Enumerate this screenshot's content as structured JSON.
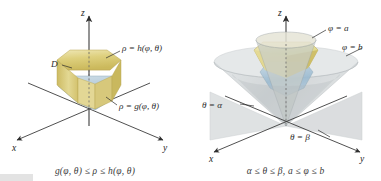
{
  "figure": {
    "background_color": "#ffffff",
    "panels": [
      {
        "id": "left",
        "caption": "g(φ, θ) ≤ ρ ≤ h(φ, θ)",
        "axes": {
          "x": "x",
          "y": "y",
          "z": "z"
        },
        "labels": [
          {
            "name": "rho-h-label",
            "text": "ρ = h(φ, θ)"
          },
          {
            "name": "rho-g-label",
            "text": "ρ = g(φ, θ)"
          },
          {
            "name": "region-d-label",
            "text": "D"
          }
        ],
        "colors": {
          "top_surface": "#d9c96a",
          "top_surface_light": "#e8dfa0",
          "side_surface": "#ded08b",
          "bottom_surface": "#aac4d4",
          "bottom_surface_light": "#c6d8e3",
          "axis": "#3c3c3c"
        }
      },
      {
        "id": "right",
        "caption": "α ≤ θ ≤ β, a ≤ φ ≤ b",
        "axes": {
          "x": "x",
          "y": "y",
          "z": "z"
        },
        "labels": [
          {
            "name": "phi-a-label",
            "text": "φ = a"
          },
          {
            "name": "phi-b-label",
            "text": "φ = b"
          },
          {
            "name": "theta-alpha-label",
            "text": "θ = α"
          },
          {
            "name": "theta-beta-label",
            "text": "θ = β"
          }
        ],
        "colors": {
          "cone_outer": "#b9bfc2",
          "cone_inner": "#9aa3a8",
          "plane": "#c3c8ca",
          "solid_top": "#d9c96a",
          "solid_bottom": "#9fbccf",
          "axis": "#3c3c3c"
        }
      }
    ]
  }
}
